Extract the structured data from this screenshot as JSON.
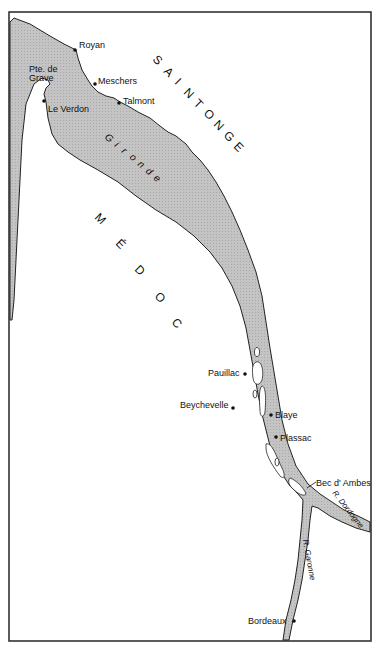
{
  "map": {
    "colors": {
      "water": "#bdbdbd",
      "land": "#ffffff",
      "outline": "#222222",
      "frame": "#333333"
    },
    "regions": {
      "saintonge": "SAINTONGE",
      "medoc": "MÉDOC"
    },
    "region_letters": {
      "saintonge": [
        "S",
        "A",
        "I",
        "N",
        "T",
        "O",
        "N",
        "G",
        "E"
      ],
      "medoc": [
        "M",
        "É",
        "D",
        "O",
        "C"
      ]
    },
    "water_bodies": {
      "gironde": "Gironde",
      "gironde_letters": [
        "G",
        "i",
        "r",
        "o",
        "n",
        "d",
        "e"
      ],
      "dordogne": "R. Dordogne",
      "garonne": "R. Garonne"
    },
    "towns": [
      {
        "name": "Royan"
      },
      {
        "name": "Pte. de"
      },
      {
        "name": "Grave"
      },
      {
        "name": "Meschers"
      },
      {
        "name": "Talmont"
      },
      {
        "name": "Le Verdon"
      },
      {
        "name": "Pauillac"
      },
      {
        "name": "Beychevelle"
      },
      {
        "name": "Blaye"
      },
      {
        "name": "Plassac"
      },
      {
        "name": "Bec d' Ambes"
      },
      {
        "name": "Bordeaux"
      }
    ]
  }
}
